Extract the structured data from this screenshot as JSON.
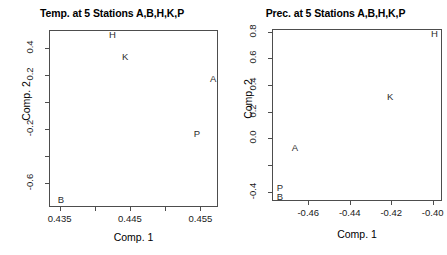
{
  "figure": {
    "background": "#ffffff",
    "axis_color": "#4d4d4d",
    "text_color": "#000000"
  },
  "chart_data": [
    {
      "type": "scatter",
      "panel_id": "left",
      "title": "Temp. at 5 Stations A,B,H,K,P",
      "xlabel": "Comp. 1",
      "ylabel": "Comp. 2",
      "grid": false,
      "legend": "none",
      "marker_style": "text-label",
      "xlim": [
        0.4335,
        0.4575
      ],
      "ylim": [
        -0.78,
        0.53
      ],
      "xticks": [
        0.435,
        0.44,
        0.445,
        0.45,
        0.455
      ],
      "xticklabels": [
        "0.435",
        "",
        "0.445",
        "",
        "0.455"
      ],
      "yticks": [
        0.4,
        0.2,
        0.0,
        -0.2,
        -0.4,
        -0.6
      ],
      "yticklabels": [
        "0.4",
        "0.2",
        "",
        "-0.2",
        "",
        "-0.6"
      ],
      "points": [
        {
          "label": "H",
          "x": 0.4425,
          "y": 0.49
        },
        {
          "label": "K",
          "x": 0.4443,
          "y": 0.33
        },
        {
          "label": "A",
          "x": 0.4568,
          "y": 0.17
        },
        {
          "label": "P",
          "x": 0.4545,
          "y": -0.24
        },
        {
          "label": "B",
          "x": 0.4352,
          "y": -0.73
        }
      ]
    },
    {
      "type": "scatter",
      "panel_id": "right",
      "title": "Prec. at 5 Stations A,B,H,K,P",
      "xlabel": "Comp. 1",
      "ylabel": "Comp. 2",
      "grid": false,
      "legend": "none",
      "marker_style": "text-label",
      "xlim": [
        -0.4775,
        -0.3955
      ],
      "ylim": [
        -0.47,
        0.82
      ],
      "xticks": [
        -0.46,
        -0.44,
        -0.42,
        -0.4
      ],
      "xticklabels": [
        "-0.46",
        "-0.44",
        "-0.42",
        "-0.40"
      ],
      "yticks": [
        0.8,
        0.6,
        0.4,
        0.2,
        0.0,
        -0.2,
        -0.4
      ],
      "yticklabels": [
        "0.8",
        "0.6",
        "0.4",
        "0.2",
        "0.0",
        "",
        "-0.4"
      ],
      "points": [
        {
          "label": "H",
          "x": -0.3992,
          "y": 0.78
        },
        {
          "label": "K",
          "x": -0.4205,
          "y": 0.31
        },
        {
          "label": "A",
          "x": -0.4665,
          "y": -0.07
        },
        {
          "label": "P",
          "x": -0.4737,
          "y": -0.37
        },
        {
          "label": "B",
          "x": -0.4737,
          "y": -0.44
        }
      ]
    }
  ]
}
